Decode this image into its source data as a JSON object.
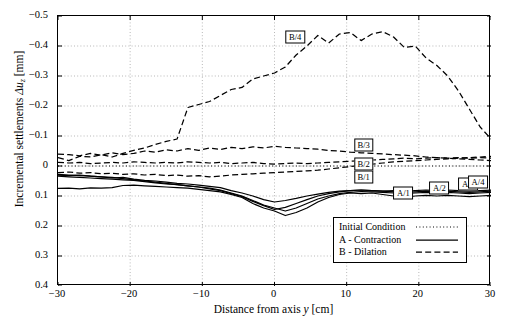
{
  "chart_data": {
    "type": "line",
    "title": "",
    "xlabel": "Distance from axis y [cm]",
    "ylabel": "Incremental settlements Δu_z [mm]",
    "xlim": [
      -30,
      30
    ],
    "ylim": [
      -0.5,
      0.4
    ],
    "y_inverted": true,
    "grid": true,
    "xticks": [
      -30,
      -20,
      -10,
      0,
      10,
      20,
      30
    ],
    "yticks": [
      -0.5,
      -0.4,
      -0.3,
      -0.2,
      -0.1,
      0,
      0.1,
      0.2,
      0.3,
      0.4
    ],
    "xticklabels": [
      "−30",
      "−20",
      "−10",
      "0",
      "10",
      "20",
      "30"
    ],
    "yticklabels": [
      "−0.5",
      "−0.4",
      "−0.3",
      "−0.2",
      "−0.1",
      "0",
      "0.1",
      "0.2",
      "0.3",
      "0.4"
    ],
    "legend_position": "lower right",
    "legend_entries": [
      {
        "label": "Initial Condition",
        "style": "dotted"
      },
      {
        "label": "A - Contraction",
        "style": "solid"
      },
      {
        "label": "B - Dilation",
        "style": "dashed"
      }
    ],
    "x": [
      -30,
      -28.5,
      -27,
      -25.5,
      -24,
      -22.5,
      -21,
      -19.5,
      -18,
      -16.5,
      -15,
      -13.5,
      -12,
      -10.5,
      -9,
      -7.5,
      -6,
      -4.5,
      -3,
      -1.5,
      0,
      1.5,
      3,
      4.5,
      6,
      7.5,
      9,
      10.5,
      12,
      13.5,
      15,
      16.5,
      18,
      19.5,
      21,
      22.5,
      24,
      25.5,
      27,
      28.5,
      30
    ],
    "series": [
      {
        "name": "Initial Condition",
        "style": "dotted",
        "values": [
          0,
          0,
          0,
          0,
          0,
          0,
          0,
          0,
          0,
          0,
          0,
          0,
          0,
          0,
          0,
          0,
          0,
          0,
          0,
          0,
          0,
          0,
          0,
          0,
          0,
          0,
          0,
          0,
          0,
          0,
          0,
          0,
          0,
          0,
          0,
          0,
          0,
          0,
          0,
          0,
          0
        ]
      },
      {
        "name": "B/4",
        "style": "dashed",
        "values": [
          -0.028,
          -0.018,
          -0.032,
          -0.03,
          -0.038,
          -0.03,
          -0.042,
          -0.052,
          -0.06,
          -0.072,
          -0.082,
          -0.09,
          -0.195,
          -0.205,
          -0.215,
          -0.235,
          -0.255,
          -0.262,
          -0.29,
          -0.3,
          -0.31,
          -0.33,
          -0.37,
          -0.4,
          -0.435,
          -0.41,
          -0.44,
          -0.445,
          -0.418,
          -0.44,
          -0.448,
          -0.43,
          -0.395,
          -0.4,
          -0.36,
          -0.335,
          -0.3,
          -0.25,
          -0.19,
          -0.13,
          -0.09
        ]
      },
      {
        "name": "B/3",
        "style": "dashed",
        "values": [
          -0.04,
          -0.038,
          -0.034,
          -0.042,
          -0.036,
          -0.044,
          -0.038,
          -0.042,
          -0.05,
          -0.046,
          -0.054,
          -0.05,
          -0.058,
          -0.052,
          -0.06,
          -0.055,
          -0.062,
          -0.058,
          -0.064,
          -0.06,
          -0.066,
          -0.062,
          -0.06,
          -0.058,
          -0.056,
          -0.052,
          -0.05,
          -0.046,
          -0.044,
          -0.042,
          -0.04,
          -0.038,
          -0.036,
          -0.034,
          -0.03,
          -0.028,
          -0.026,
          -0.024,
          -0.022,
          -0.02,
          -0.018
        ]
      },
      {
        "name": "B/2",
        "style": "dashed",
        "values": [
          -0.012,
          -0.01,
          -0.012,
          -0.008,
          -0.01,
          -0.012,
          -0.01,
          -0.014,
          -0.012,
          -0.01,
          -0.012,
          -0.01,
          -0.014,
          -0.012,
          -0.01,
          -0.012,
          -0.008,
          -0.01,
          -0.012,
          -0.008,
          -0.006,
          -0.008,
          -0.01,
          -0.008,
          -0.01,
          -0.012,
          -0.014,
          -0.016,
          -0.018,
          -0.02,
          -0.022,
          -0.024,
          -0.026,
          -0.024,
          -0.026,
          -0.028,
          -0.026,
          -0.028,
          -0.026,
          -0.028,
          -0.026
        ]
      },
      {
        "name": "B/1",
        "style": "dashed",
        "values": [
          0.022,
          0.02,
          0.024,
          0.022,
          0.026,
          0.024,
          0.028,
          0.026,
          0.03,
          0.028,
          0.032,
          0.03,
          0.034,
          0.032,
          0.036,
          0.034,
          0.03,
          0.028,
          0.026,
          0.024,
          0.022,
          0.02,
          0.018,
          0.016,
          0.014,
          0.01,
          0.006,
          0.002,
          -0.002,
          -0.006,
          -0.01,
          -0.014,
          -0.016,
          -0.018,
          -0.02,
          -0.022,
          -0.024,
          -0.026,
          -0.028,
          -0.03,
          -0.032
        ]
      },
      {
        "name": "A/1",
        "style": "solid",
        "values": [
          0.075,
          0.074,
          0.076,
          0.073,
          0.074,
          0.072,
          0.065,
          0.064,
          0.066,
          0.068,
          0.07,
          0.072,
          0.074,
          0.078,
          0.082,
          0.086,
          0.095,
          0.105,
          0.125,
          0.14,
          0.15,
          0.165,
          0.155,
          0.14,
          0.12,
          0.105,
          0.095,
          0.09,
          0.092,
          0.09,
          0.095,
          0.1,
          0.105,
          0.1,
          0.098,
          0.1,
          0.098,
          0.1,
          0.102,
          0.1,
          0.098
        ]
      },
      {
        "name": "A/2",
        "style": "solid",
        "values": [
          0.034,
          0.036,
          0.038,
          0.04,
          0.042,
          0.044,
          0.046,
          0.048,
          0.052,
          0.056,
          0.06,
          0.062,
          0.066,
          0.07,
          0.074,
          0.08,
          0.09,
          0.1,
          0.115,
          0.13,
          0.14,
          0.15,
          0.14,
          0.125,
          0.11,
          0.1,
          0.092,
          0.088,
          0.085,
          0.086,
          0.088,
          0.09,
          0.092,
          0.09,
          0.088,
          0.09,
          0.088,
          0.09,
          0.092,
          0.09,
          0.088
        ]
      },
      {
        "name": "A/3",
        "style": "solid",
        "values": [
          0.028,
          0.03,
          0.032,
          0.034,
          0.036,
          0.038,
          0.042,
          0.046,
          0.05,
          0.054,
          0.058,
          0.062,
          0.066,
          0.07,
          0.076,
          0.082,
          0.092,
          0.102,
          0.118,
          0.132,
          0.145,
          0.138,
          0.125,
          0.112,
          0.1,
          0.092,
          0.086,
          0.082,
          0.08,
          0.082,
          0.084,
          0.086,
          0.088,
          0.086,
          0.084,
          0.086,
          0.084,
          0.086,
          0.088,
          0.086,
          0.084
        ]
      },
      {
        "name": "A/4",
        "style": "solid",
        "values": [
          0.03,
          0.032,
          0.03,
          0.034,
          0.036,
          0.04,
          0.038,
          0.044,
          0.048,
          0.05,
          0.054,
          0.058,
          0.06,
          0.064,
          0.068,
          0.072,
          0.082,
          0.09,
          0.1,
          0.112,
          0.12,
          0.115,
          0.108,
          0.1,
          0.094,
          0.088,
          0.084,
          0.082,
          0.08,
          0.082,
          0.084,
          0.082,
          0.084,
          0.082,
          0.08,
          0.082,
          0.08,
          0.082,
          0.084,
          0.082,
          0.08
        ]
      }
    ],
    "annotations": [
      {
        "label": "B/4",
        "x": 3.0,
        "y": -0.428
      },
      {
        "label": "B/3",
        "x": 12.5,
        "y": -0.068
      },
      {
        "label": "B/2",
        "x": 12.5,
        "y": -0.005
      },
      {
        "label": "B/1",
        "x": 12.5,
        "y": 0.04
      },
      {
        "label": "A/1",
        "x": 18.0,
        "y": 0.093
      },
      {
        "label": "A/2",
        "x": 23.0,
        "y": 0.078
      },
      {
        "label": "A/3",
        "x": 27.0,
        "y": 0.063
      },
      {
        "label": "A/4",
        "x": 31.5,
        "y": 0.055
      }
    ]
  }
}
